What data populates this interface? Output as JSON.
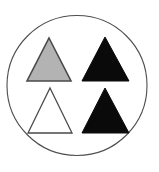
{
  "figure": {
    "width": 159,
    "height": 172,
    "background_color": "#ffffff"
  },
  "container": {
    "name": "circle-outline",
    "shape": "circle",
    "center_x": 77,
    "center_y": 85.5,
    "radius": 70,
    "fill_color": "#ffffff",
    "stroke_color": "#4d4d4d",
    "stroke_width": 1.1
  },
  "shapes": [
    {
      "id": "triangle-top-left",
      "label": "Gray triangle",
      "shape": "triangle",
      "orientation": "point-up",
      "grid_row": 1,
      "grid_column": 1,
      "fill_color": "#b3b3b3",
      "stroke_color": "#4a4a4a",
      "stroke_width": 1.6,
      "apex_x": 49,
      "apex_y": 38,
      "base_left_x": 27,
      "base_right_x": 71,
      "base_y": 81,
      "points": "49,38 71,81 27,81"
    },
    {
      "id": "triangle-top-right",
      "label": "Black triangle",
      "shape": "triangle",
      "orientation": "point-up",
      "grid_row": 1,
      "grid_column": 2,
      "fill_color": "#0a0a0a",
      "stroke_color": "#0a0a0a",
      "stroke_width": 1,
      "apex_x": 105,
      "apex_y": 37,
      "base_left_x": 82,
      "base_right_x": 129,
      "base_y": 81,
      "points": "105,37 129,81 82,81"
    },
    {
      "id": "triangle-bottom-left",
      "label": "White triangle",
      "shape": "triangle",
      "orientation": "point-up",
      "grid_row": 2,
      "grid_column": 1,
      "fill_color": "#ffffff",
      "stroke_color": "#4a4a4a",
      "stroke_width": 1.3,
      "apex_x": 50,
      "apex_y": 88,
      "base_left_x": 28,
      "base_right_x": 72,
      "base_y": 133,
      "points": "50,88 72,133 28,133"
    },
    {
      "id": "triangle-bottom-right",
      "label": "Black triangle",
      "shape": "triangle",
      "orientation": "point-up",
      "grid_row": 2,
      "grid_column": 2,
      "fill_color": "#0a0a0a",
      "stroke_color": "#0a0a0a",
      "stroke_width": 1,
      "apex_x": 105,
      "apex_y": 88,
      "base_left_x": 82,
      "base_right_x": 129,
      "base_y": 133,
      "points": "105,88 129,133 82,133"
    }
  ]
}
